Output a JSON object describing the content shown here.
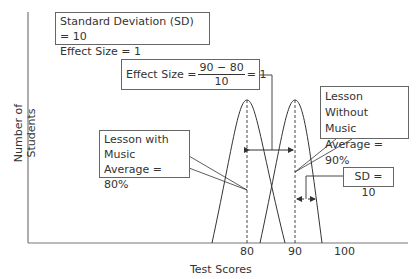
{
  "diagram": {
    "info_box": {
      "line1": "Standard Deviation (SD) = 10",
      "line2": "Effect Size = 1"
    },
    "effect_size_box": {
      "prefix": "Effect Size =",
      "numerator": "90 − 80",
      "denominator": "10",
      "suffix": "= 1"
    },
    "music_box": {
      "line1": "Lesson with",
      "line2": "Music",
      "line3": "Average = 80%"
    },
    "no_music_box": {
      "line1": "Lesson Without",
      "line2": "Music",
      "line3": "Average = 90%"
    },
    "sd_box": {
      "text": "SD = 10"
    },
    "axes": {
      "x_label": "Test Scores",
      "y_label": "Number of Students",
      "x_ticks": [
        "80",
        "90",
        "100"
      ]
    },
    "colors": {
      "line": "#444444",
      "box_border": "#666666",
      "text": "#333333"
    }
  }
}
